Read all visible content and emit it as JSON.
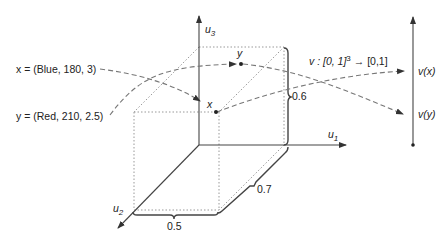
{
  "diagram": {
    "axes": {
      "u1_label": "u",
      "u1_sub": "1",
      "u2_label": "u",
      "u2_sub": "2",
      "u3_label": "u",
      "u3_sub": "3"
    },
    "points": {
      "x_label": "x",
      "y_label": "y"
    },
    "annotations": {
      "x_def": "x = (Blue, 180, 3)",
      "y_def": "y = (Red, 210, 2.5)",
      "map_prefix": "v : [0, 1]",
      "map_exp": "3",
      "map_suffix": " → [0,1]",
      "vx_label": "v(x)",
      "vy_label": "v(y)"
    },
    "dimensions": {
      "height": "0.6",
      "depth": "0.7",
      "width": "0.5"
    },
    "colors": {
      "line": "#444444",
      "dotted": "#999999",
      "dashed": "#777777",
      "text": "#222222"
    }
  }
}
